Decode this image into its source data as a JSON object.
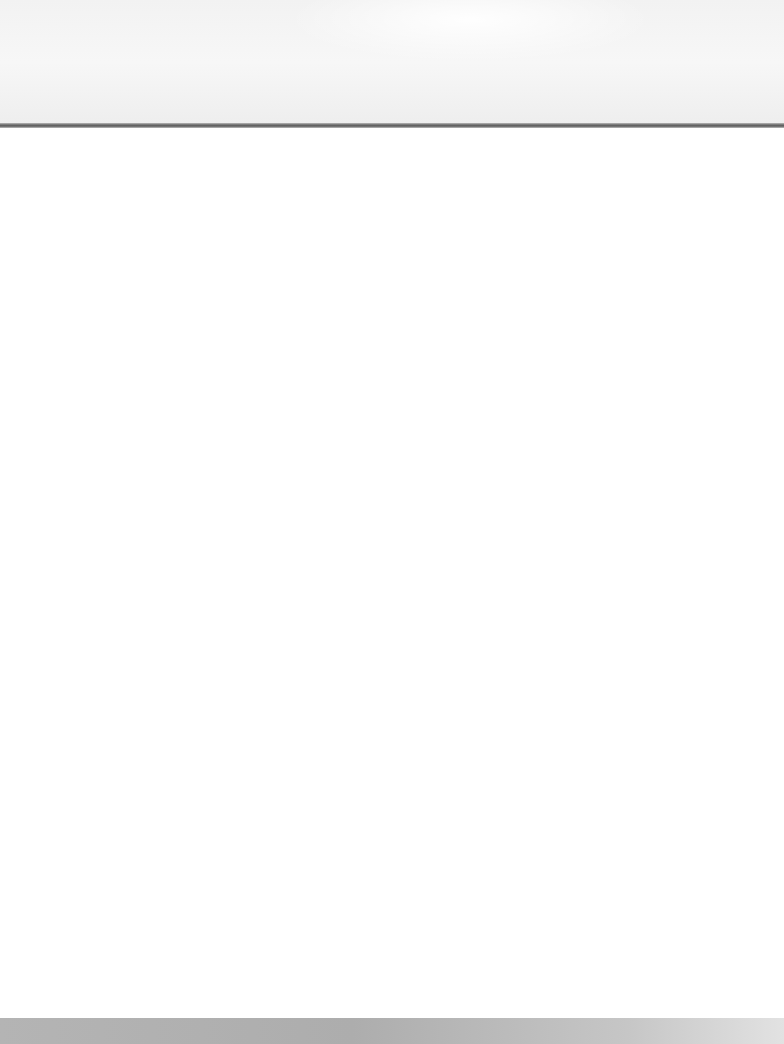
{
  "page": {
    "header_text": "",
    "body_text": ""
  },
  "colors": {
    "background": "#ffffff",
    "header": "#f2f2f2",
    "rule": "#5e5e5e",
    "footer": "#b4b4b4"
  }
}
